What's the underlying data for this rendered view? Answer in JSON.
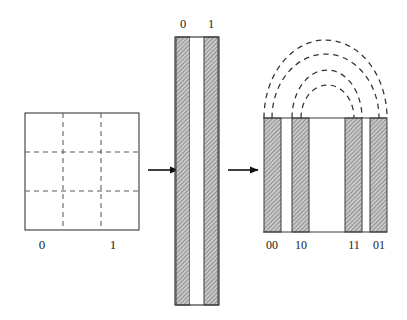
{
  "figure": {
    "background_color": "#ffffff",
    "width": 407,
    "height": 320
  },
  "palette": {
    "outline": "#3a3a3a",
    "dash_stroke": "#5a5a5a",
    "arc_stroke": "#333333",
    "arrow": "#101010",
    "hatch_fill": "#b9b9b9",
    "hatch_line": "#6e6e6e",
    "text": "#1c1c1c",
    "white": "#ffffff"
  },
  "panels": [
    {
      "id": "square-panel",
      "name": "subdivided-square",
      "x": 25,
      "y": 113,
      "width": 114,
      "height": 117,
      "grid_rows": 3,
      "grid_cols": 3,
      "grid_style": "dashed",
      "fill": "#ffffff",
      "labels": [
        {
          "text": "0",
          "x": 42,
          "y": 246
        },
        {
          "text": "1",
          "x": 113,
          "y": 246
        }
      ]
    },
    {
      "id": "column-panel",
      "name": "tall-column",
      "x": 175,
      "y": 37,
      "width": 44,
      "height": 268,
      "bands": [
        {
          "label": "0",
          "x": 176,
          "width": 14,
          "hatched": true
        },
        {
          "label": "",
          "x": 190,
          "width": 14,
          "hatched": false
        },
        {
          "label": "1",
          "x": 204,
          "width": 14,
          "hatched": true
        }
      ],
      "labels": [
        {
          "text": "0",
          "x": 183,
          "y": 24
        },
        {
          "text": "1",
          "x": 211,
          "y": 24
        }
      ]
    },
    {
      "id": "code-panel",
      "name": "interleaved-band-panel",
      "x": 263,
      "y": 118,
      "width": 124,
      "height": 114,
      "bands": [
        {
          "label": "00",
          "x": 264,
          "width": 17,
          "hatched": true
        },
        {
          "label": "",
          "x": 281,
          "width": 11,
          "hatched": false
        },
        {
          "label": "10",
          "x": 292,
          "width": 17,
          "hatched": true
        },
        {
          "label": "",
          "x": 309,
          "width": 36,
          "hatched": false
        },
        {
          "label": "11",
          "x": 345,
          "width": 17,
          "hatched": true
        },
        {
          "label": "",
          "x": 362,
          "width": 8,
          "hatched": false
        },
        {
          "label": "01",
          "x": 370,
          "width": 17,
          "hatched": true
        }
      ],
      "labels": [
        {
          "text": "00",
          "x": 272,
          "y": 246
        },
        {
          "text": "10",
          "x": 301,
          "y": 246
        },
        {
          "text": "11",
          "x": 354,
          "y": 246
        },
        {
          "text": "01",
          "x": 379,
          "y": 246
        }
      ],
      "arcs": [
        {
          "id": "arc-1",
          "left_x": 264,
          "right_x": 387,
          "baseline_y": 118,
          "height": 78
        },
        {
          "id": "arc-2",
          "left_x": 272,
          "right_x": 379,
          "baseline_y": 118,
          "height": 64
        },
        {
          "id": "arc-3",
          "left_x": 292,
          "right_x": 362,
          "baseline_y": 118,
          "height": 48
        },
        {
          "id": "arc-4",
          "left_x": 301,
          "right_x": 354,
          "baseline_y": 118,
          "height": 33
        }
      ]
    }
  ],
  "arrows": [
    {
      "id": "arrow-1",
      "name": "arrow-square-to-column",
      "x1": 148,
      "x2": 180,
      "y": 170
    },
    {
      "id": "arrow-2",
      "name": "arrow-column-to-codes",
      "x1": 228,
      "x2": 260,
      "y": 170
    }
  ]
}
